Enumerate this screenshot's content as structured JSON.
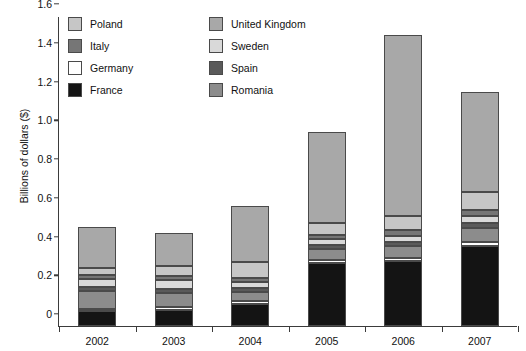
{
  "chart_data": {
    "type": "bar",
    "stacked": true,
    "title": "",
    "xlabel": "",
    "ylabel": "Billions of dollars ($)",
    "categories": [
      "2002",
      "2003",
      "2004",
      "2005",
      "2006",
      "2007"
    ],
    "ylim": [
      0,
      1.6
    ],
    "ytick_labels": [
      "0",
      "0.2",
      "0.4",
      "0.6",
      "0.8",
      "1.0",
      "1.2",
      "1.4",
      "1.6"
    ],
    "ytick_values": [
      0,
      0.2,
      0.4,
      0.6,
      0.8,
      1.0,
      1.2,
      1.4,
      1.6
    ],
    "grid": false,
    "legend_position": "top-inside",
    "series": [
      {
        "name": "France",
        "color": "#141414",
        "values": [
          0.075,
          0.085,
          0.115,
          0.325,
          0.335,
          0.415
        ]
      },
      {
        "name": "Germany",
        "color": "#ffffff",
        "values": [
          0.012,
          0.012,
          0.015,
          0.015,
          0.018,
          0.018
        ]
      },
      {
        "name": "Romania",
        "color": "#8c8c8c",
        "values": [
          0.095,
          0.075,
          0.045,
          0.055,
          0.06,
          0.075
        ]
      },
      {
        "name": "Spain",
        "color": "#5a5a5a",
        "values": [
          0.02,
          0.02,
          0.02,
          0.022,
          0.022,
          0.025
        ]
      },
      {
        "name": "Sweden",
        "color": "#d9d9d9",
        "values": [
          0.04,
          0.045,
          0.03,
          0.03,
          0.032,
          0.035
        ]
      },
      {
        "name": "Italy",
        "color": "#767676",
        "values": [
          0.022,
          0.02,
          0.022,
          0.025,
          0.028,
          0.03
        ]
      },
      {
        "name": "Poland",
        "color": "#c6c6c6",
        "values": [
          0.036,
          0.053,
          0.083,
          0.058,
          0.075,
          0.092
        ]
      },
      {
        "name": "United Kingdom",
        "color": "#a8a8a8",
        "values": [
          0.21,
          0.17,
          0.29,
          0.47,
          0.93,
          0.52
        ]
      }
    ],
    "totals": [
      0.51,
      0.48,
      0.62,
      1.0,
      1.5,
      1.21
    ]
  },
  "legend": {
    "items": [
      {
        "label": "Poland",
        "color": "#c6c6c6"
      },
      {
        "label": "Italy",
        "color": "#767676"
      },
      {
        "label": "Germany",
        "color": "#ffffff"
      },
      {
        "label": "France",
        "color": "#141414"
      },
      {
        "label": "United Kingdom",
        "color": "#a8a8a8"
      },
      {
        "label": "Sweden",
        "color": "#d9d9d9"
      },
      {
        "label": "Spain",
        "color": "#5a5a5a"
      },
      {
        "label": "Romania",
        "color": "#8c8c8c"
      }
    ]
  },
  "axis": {
    "y_title": "Billions of dollars ($)"
  }
}
